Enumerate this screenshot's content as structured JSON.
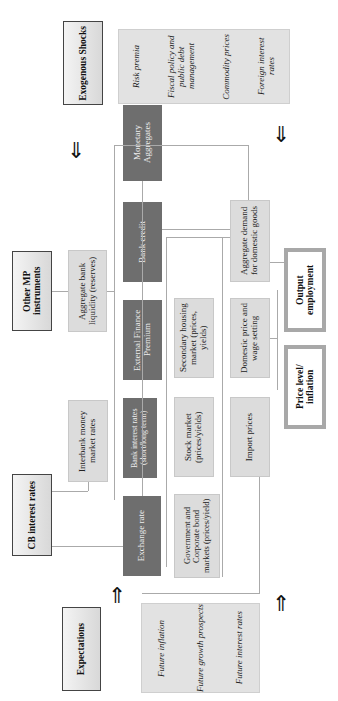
{
  "headers": {
    "exogenous_shocks": "Exogenous Shocks",
    "other_mp_instruments": "Other MP instruments",
    "cb_interest_rates": "CB interest rates",
    "expectations": "Expectations"
  },
  "exogenous_list": [
    "Foreign interest rates",
    "Commodity prices",
    "Fiscal policy and public debt management",
    "Risk premia"
  ],
  "expectations_list": [
    "Future interest rates",
    "Future growth prospects",
    "Future inflation"
  ],
  "dark_nodes": {
    "monetary_aggregates": "Monetary Aggregates",
    "bank_credit": "Bank credit",
    "external_finance_premium": "External Finance Premium",
    "bank_interest_rates": "Bank interest rates (short/long term)",
    "exchange_rate": "Exchange rate"
  },
  "light_nodes": {
    "aggregate_bank_liquidity": "Aggregate bank liquidity (reserves)",
    "interbank_money_market_rates": "Interbank money market rates",
    "secondary_housing_market": "Secondary housing market (prices, yields)",
    "stock_market": "Stock market (prices/yields)",
    "gov_corporate_bond_markets": "Government and Corporate bond markets (prices/yield)",
    "aggregate_demand": "Aggregate demand for domestic goods",
    "domestic_price_wage": "Domestic price and wage setting",
    "import_prices": "Import prices"
  },
  "outcomes": {
    "output_employment": "Output employment",
    "price_level_inflation": "Price level/ inflation"
  },
  "arrows": {
    "down": "⇓",
    "up": "⇑"
  }
}
